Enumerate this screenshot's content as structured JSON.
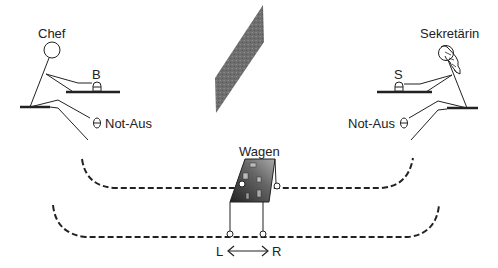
{
  "labels": {
    "chef": "Chef",
    "secretary": "Sekretärin",
    "button_chef": "B",
    "button_secretary": "S",
    "emergency_stop_left": "Not-Aus",
    "emergency_stop_right": "Not-Aus",
    "cart": "Wagen",
    "direction_left": "L",
    "direction_right": "R"
  },
  "colors": {
    "line": "#222222",
    "wall": "#707070",
    "cart_dark": "#333333",
    "cart_light": "#9a9a9a"
  }
}
